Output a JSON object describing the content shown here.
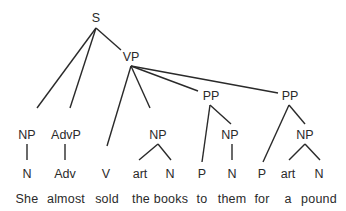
{
  "diagram": {
    "type": "syntax-tree",
    "sentence": "She almost sold the books to them for a pound",
    "line_color": "#2a2a2a",
    "nodes": [
      {
        "id": "S",
        "label": "S",
        "x": 96,
        "y": 12
      },
      {
        "id": "VP",
        "label": "VP",
        "x": 131,
        "y": 51
      },
      {
        "id": "NP1",
        "label": "NP",
        "x": 27,
        "y": 129
      },
      {
        "id": "AdvP",
        "label": "AdvP",
        "x": 66,
        "y": 129
      },
      {
        "id": "NP2",
        "label": "NP",
        "x": 158,
        "y": 129
      },
      {
        "id": "PP1",
        "label": "PP",
        "x": 211,
        "y": 90
      },
      {
        "id": "PP2",
        "label": "PP",
        "x": 290,
        "y": 90
      },
      {
        "id": "NP3",
        "label": "NP",
        "x": 230,
        "y": 129
      },
      {
        "id": "NP4",
        "label": "NP",
        "x": 305,
        "y": 129
      },
      {
        "id": "N1",
        "label": "N",
        "x": 27,
        "y": 168
      },
      {
        "id": "Adv",
        "label": "Adv",
        "x": 65,
        "y": 168
      },
      {
        "id": "V",
        "label": "V",
        "x": 106,
        "y": 168
      },
      {
        "id": "art1",
        "label": "art",
        "x": 140,
        "y": 168
      },
      {
        "id": "N2",
        "label": "N",
        "x": 170,
        "y": 168
      },
      {
        "id": "P1",
        "label": "P",
        "x": 202,
        "y": 168
      },
      {
        "id": "N3",
        "label": "N",
        "x": 232,
        "y": 168
      },
      {
        "id": "P2",
        "label": "P",
        "x": 262,
        "y": 168
      },
      {
        "id": "art2",
        "label": "art",
        "x": 288,
        "y": 168
      },
      {
        "id": "N4",
        "label": "N",
        "x": 319,
        "y": 168
      }
    ],
    "edges": [
      {
        "from": "S",
        "to": "NP1",
        "x1": 96,
        "y1": 28,
        "x2": 37,
        "y2": 108
      },
      {
        "from": "S",
        "to": "AdvP",
        "x1": 96,
        "y1": 28,
        "x2": 70,
        "y2": 108
      },
      {
        "from": "S",
        "to": "VP",
        "x1": 96,
        "y1": 28,
        "x2": 121,
        "y2": 50
      },
      {
        "from": "VP",
        "to": "V",
        "x1": 131,
        "y1": 66,
        "x2": 107,
        "y2": 146
      },
      {
        "from": "VP",
        "to": "NP2",
        "x1": 131,
        "y1": 66,
        "x2": 150,
        "y2": 108
      },
      {
        "from": "VP",
        "to": "PP1",
        "x1": 131,
        "y1": 66,
        "x2": 198,
        "y2": 91
      },
      {
        "from": "VP",
        "to": "PP2",
        "x1": 131,
        "y1": 66,
        "x2": 278,
        "y2": 93
      },
      {
        "from": "NP1",
        "to": "N1",
        "x1": 27,
        "y1": 144,
        "x2": 27,
        "y2": 160
      },
      {
        "from": "AdvP",
        "to": "Adv",
        "x1": 65,
        "y1": 144,
        "x2": 65,
        "y2": 160
      },
      {
        "from": "NP2",
        "to": "art1",
        "x1": 158,
        "y1": 144,
        "x2": 139,
        "y2": 160
      },
      {
        "from": "NP2",
        "to": "N2",
        "x1": 158,
        "y1": 144,
        "x2": 171,
        "y2": 160
      },
      {
        "from": "PP1",
        "to": "P1",
        "x1": 210,
        "y1": 105,
        "x2": 202,
        "y2": 162
      },
      {
        "from": "PP1",
        "to": "NP3",
        "x1": 210,
        "y1": 105,
        "x2": 231,
        "y2": 124
      },
      {
        "from": "NP3",
        "to": "N3",
        "x1": 232,
        "y1": 144,
        "x2": 232,
        "y2": 160
      },
      {
        "from": "PP2",
        "to": "P2",
        "x1": 289,
        "y1": 105,
        "x2": 263,
        "y2": 162
      },
      {
        "from": "PP2",
        "to": "NP4",
        "x1": 289,
        "y1": 105,
        "x2": 305,
        "y2": 124
      },
      {
        "from": "NP4",
        "to": "art2",
        "x1": 305,
        "y1": 144,
        "x2": 289,
        "y2": 160
      },
      {
        "from": "NP4",
        "to": "N4",
        "x1": 305,
        "y1": 144,
        "x2": 320,
        "y2": 160
      }
    ],
    "words": [
      {
        "text": "She",
        "x": 27,
        "y": 193
      },
      {
        "text": "almost",
        "x": 66,
        "y": 193
      },
      {
        "text": "sold",
        "x": 107,
        "y": 193
      },
      {
        "text": "the",
        "x": 141,
        "y": 193
      },
      {
        "text": "books",
        "x": 171,
        "y": 193
      },
      {
        "text": "to",
        "x": 202,
        "y": 193
      },
      {
        "text": "them",
        "x": 232,
        "y": 193
      },
      {
        "text": "for",
        "x": 262,
        "y": 193
      },
      {
        "text": "a",
        "x": 288,
        "y": 193
      },
      {
        "text": "pound",
        "x": 319,
        "y": 193
      }
    ]
  }
}
